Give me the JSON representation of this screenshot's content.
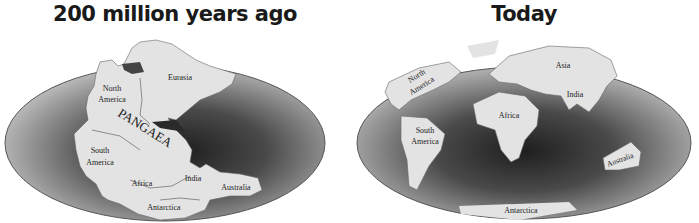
{
  "left": {
    "title": "200 million years ago",
    "supercontinent": "PANGAEA",
    "labels": {
      "north_america_1": "North",
      "north_america_2": "America",
      "eurasia": "Eurasia",
      "south_america_1": "South",
      "south_america_2": "America",
      "africa": "Africa",
      "india": "India",
      "australia": "Australia",
      "antarctica": "Antarctica"
    }
  },
  "right": {
    "title": "Today",
    "labels": {
      "north_america_1": "North",
      "north_america_2": "America",
      "asia": "Asia",
      "india": "India",
      "africa": "Africa",
      "south_america_1": "South",
      "south_america_2": "America",
      "australia": "Australia",
      "antarctica": "Antarctica"
    }
  },
  "colors": {
    "ocean_dark": "#2e2e2e",
    "ocean_light": "#b9b9b9",
    "land": "#e2e2e2",
    "text": "#222222"
  }
}
